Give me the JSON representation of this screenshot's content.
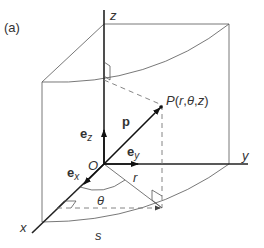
{
  "figure": {
    "panel_label": "(a)",
    "axes": {
      "x": "x",
      "y": "y",
      "z": "z"
    },
    "origin_label": "O",
    "point_label": {
      "P": "P",
      "open": "(",
      "r": "r",
      "c1": ",",
      "theta": "θ",
      "c2": ",",
      "z": "z",
      "close": ")"
    },
    "vectors": {
      "position": "p",
      "ez": {
        "base": "e",
        "sub": "z"
      },
      "ey": {
        "base": "e",
        "sub": "y"
      },
      "ex": {
        "base": "e",
        "sub": "x"
      }
    },
    "radius_label": "r",
    "angle_label": "θ",
    "arc_label": "s"
  }
}
